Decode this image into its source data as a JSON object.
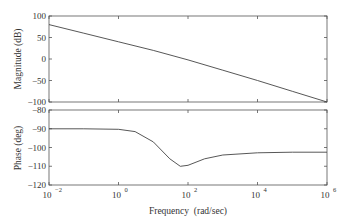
{
  "chart_data": [
    {
      "type": "line",
      "title": "",
      "xlabel": "",
      "ylabel": "Magnitude (dB)",
      "xscale": "log",
      "xlim": [
        0.01,
        1000000
      ],
      "ylim": [
        -100,
        100
      ],
      "yticks": [
        100,
        50,
        0,
        -50,
        -100
      ],
      "grid": false,
      "series": [
        {
          "name": "magnitude",
          "x": [
            0.01,
            0.1,
            1,
            10,
            100,
            1000,
            10000,
            100000,
            1000000
          ],
          "values": [
            80,
            60,
            40,
            20,
            -2,
            -26,
            -50,
            -75,
            -100
          ]
        }
      ]
    },
    {
      "type": "line",
      "title": "",
      "xlabel": "Frequency (rad/sec)",
      "ylabel": "Phase (deg)",
      "xscale": "log",
      "xlim": [
        0.01,
        1000000
      ],
      "ylim": [
        -120,
        -80
      ],
      "yticks": [
        -80,
        -90,
        -100,
        -110,
        -120
      ],
      "xticks": [
        "10^-2",
        "10^0",
        "10^2",
        "10^4",
        "10^6"
      ],
      "grid": false,
      "series": [
        {
          "name": "phase",
          "x": [
            0.01,
            0.1,
            1,
            3,
            10,
            30,
            60,
            100,
            300,
            1000,
            10000,
            100000,
            1000000
          ],
          "values": [
            -90,
            -90,
            -90.3,
            -91.5,
            -97,
            -106,
            -110,
            -109.5,
            -106,
            -104,
            -102.8,
            -102.5,
            -102.5
          ]
        }
      ]
    }
  ],
  "labels": {
    "mag_ylabel": "Magnitude (dB)",
    "phase_ylabel": "Phase (deg)",
    "xlabel": "Frequency  (rad/sec)",
    "mag_yticks": [
      "100",
      "50",
      "0",
      "−50",
      "−100"
    ],
    "phase_yticks": [
      "−80",
      "−90",
      "−100",
      "−110",
      "−120"
    ],
    "xtick_bases": [
      "10",
      "10",
      "10",
      "10",
      "10"
    ],
    "xtick_exps": [
      "−2",
      "0",
      "2",
      "4",
      "6"
    ]
  }
}
